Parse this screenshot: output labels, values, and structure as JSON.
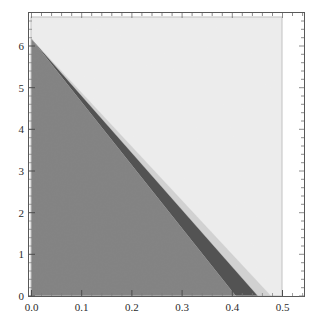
{
  "chart_data": {
    "type": "area",
    "title": "",
    "xlabel": "",
    "ylabel": "",
    "xlim": [
      0.0,
      0.5
    ],
    "ylim": [
      0,
      6.5
    ],
    "xticks": [
      0.0,
      0.1,
      0.2,
      0.3,
      0.4,
      0.5
    ],
    "xtick_labels": [
      "0.0",
      "0.1",
      "0.2",
      "0.3",
      "0.4",
      "0.5"
    ],
    "yticks": [
      0,
      1,
      2,
      3,
      4,
      5,
      6
    ],
    "ytick_labels": [
      "0",
      "1",
      "2",
      "3",
      "4",
      "5",
      "6"
    ],
    "grid": false,
    "legend": "none",
    "frame": true,
    "minor_ticks": true,
    "data_x_extent": [
      0.0,
      0.5
    ],
    "regions": [
      {
        "name": "region-darkest-gray",
        "color": "#7d7d7d",
        "description": "lower-left triangle bounded by line from (0,6) to (0.41,0)",
        "polygon": [
          [
            0.0,
            6.0
          ],
          [
            0.0,
            0.0
          ],
          [
            0.408,
            0.0
          ]
        ]
      },
      {
        "name": "region-dark-band",
        "color": "#4a4a4a",
        "description": "wedge band between line (0,6)-(0.408,0) and line (0,6)-(0.452,0)",
        "polygon": [
          [
            0.0,
            6.0
          ],
          [
            0.408,
            0.0
          ],
          [
            0.452,
            0.0
          ]
        ]
      },
      {
        "name": "region-mid-light-band",
        "color": "#cfcfcf",
        "description": "thin wedge band between line (0,6)-(0.452,0) and line (0,6)-(0.478,0)",
        "polygon": [
          [
            0.0,
            6.0
          ],
          [
            0.452,
            0.0
          ],
          [
            0.478,
            0.0
          ]
        ]
      },
      {
        "name": "region-lightest",
        "color": "#ececec",
        "description": "upper-right region above line (0,6)-(0.478,0) filling plot extent",
        "polygon": [
          [
            0.0,
            6.0
          ],
          [
            0.478,
            0.0
          ],
          [
            0.5,
            0.0
          ],
          [
            0.5,
            6.5
          ],
          [
            0.0,
            6.5
          ]
        ]
      }
    ],
    "boundary_lines": [
      {
        "name": "line-1",
        "from": [
          0.0,
          6.0
        ],
        "to": [
          0.408,
          0.0
        ],
        "slope": -14.7
      },
      {
        "name": "line-2",
        "from": [
          0.0,
          6.0
        ],
        "to": [
          0.452,
          0.0
        ],
        "slope": -13.3
      },
      {
        "name": "line-3",
        "from": [
          0.0,
          6.0
        ],
        "to": [
          0.478,
          0.0
        ],
        "slope": -12.55
      }
    ],
    "apex_point": [
      0.0,
      6.0
    ]
  },
  "colors": {
    "axis": "#4d4d4d",
    "region_dark": "#4a4a4a",
    "region_mid": "#7d7d7d",
    "region_light": "#cfcfcf",
    "region_lightest": "#ececec",
    "plot_border": "#b8b8b8",
    "background": "#ffffff",
    "tick_text": "#2b2b2b"
  }
}
